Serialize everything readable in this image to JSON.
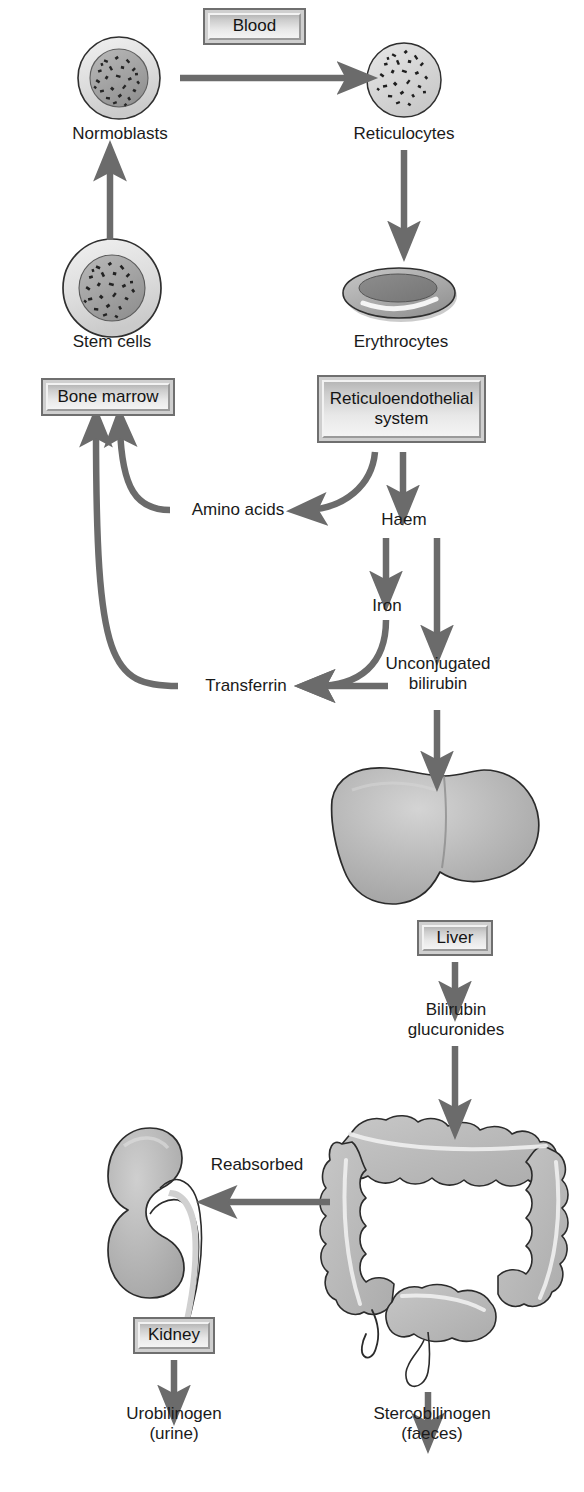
{
  "diagram": {
    "palette": {
      "arrow": "#6b6b6b",
      "outline": "#2a2a2a",
      "organ_fill": "#b4b4b4",
      "organ_light": "#d2d2d2",
      "organ_dark": "#9a9a9a",
      "box_border": "#6f6f6f",
      "box_fill": "#e3e3e3",
      "text": "#141414",
      "background": "#ffffff"
    },
    "boxes": [
      {
        "id": "blood",
        "label": "Blood",
        "x": 203,
        "y": 8,
        "w": 103,
        "h": 37
      },
      {
        "id": "bone-marrow",
        "label": "Bone marrow",
        "x": 41,
        "y": 378,
        "w": 134,
        "h": 38
      },
      {
        "id": "reticuloendothelial-system",
        "label": "Reticuloendothelial\nsystem",
        "x": 317,
        "y": 375,
        "w": 169,
        "h": 68
      },
      {
        "id": "liver",
        "label": "Liver",
        "x": 417,
        "y": 920,
        "w": 76,
        "h": 36
      },
      {
        "id": "kidney",
        "label": "Kidney",
        "x": 133,
        "y": 1317,
        "w": 82,
        "h": 37
      }
    ],
    "cell_labels": [
      {
        "id": "normoblasts",
        "label": "Normoblasts",
        "x": 60,
        "y": 124
      },
      {
        "id": "reticulocytes",
        "label": "Reticulocytes",
        "x": 338,
        "y": 124
      },
      {
        "id": "stem-cells",
        "label": "Stem cells",
        "x": 58,
        "y": 332
      },
      {
        "id": "erythrocytes",
        "label": "Erythrocytes",
        "x": 340,
        "y": 332
      }
    ],
    "node_labels": [
      {
        "id": "amino-acids",
        "label": "Amino acids",
        "x": 186,
        "y": 510
      },
      {
        "id": "haem",
        "label": "Haem",
        "x": 389,
        "y": 520
      },
      {
        "id": "iron",
        "label": "Iron",
        "x": 364,
        "y": 605
      },
      {
        "id": "transferrin",
        "label": "Transferrin",
        "x": 193,
        "y": 686
      },
      {
        "id": "unconjugated-bilirubin",
        "label": "Unconjugated\nbilirubin",
        "x": 396,
        "y": 659
      },
      {
        "id": "bilirubin-glucuronides",
        "label": "Bilirubin\nglucuronides",
        "x": 391,
        "y": 1004
      },
      {
        "id": "reabsorbed",
        "label": "Reabsorbed",
        "x": 209,
        "y": 1157
      },
      {
        "id": "urobilinogen",
        "label": "Urobilinogen\n(urine)",
        "x": 110,
        "y": 1400
      },
      {
        "id": "stercobilinogen",
        "label": "Stercobilinogen\n(faeces)",
        "x": 391,
        "y": 1400
      }
    ],
    "organs": [
      {
        "id": "normoblast-cell",
        "kind": "cell-nucleated",
        "cx": 119,
        "cy": 78,
        "r": 40
      },
      {
        "id": "reticulocyte-cell",
        "kind": "cell-speckled",
        "cx": 404,
        "cy": 80,
        "r": 36
      },
      {
        "id": "stem-cell",
        "kind": "cell-nucleated",
        "cx": 112,
        "cy": 288,
        "r": 48
      },
      {
        "id": "erythrocyte-cell",
        "kind": "biconcave-disc",
        "cx": 400,
        "cy": 294
      },
      {
        "id": "liver-organ",
        "kind": "liver",
        "cx": 420,
        "cy": 845
      },
      {
        "id": "colon-organ",
        "kind": "colon",
        "cx": 430,
        "cy": 1215
      },
      {
        "id": "kidney-organ",
        "kind": "kidney",
        "cx": 170,
        "cy": 1215
      }
    ],
    "flow_edges": [
      {
        "id": "stem-to-normoblast",
        "from": "stem-cells",
        "to": "normoblasts",
        "style": "straight-up"
      },
      {
        "id": "normoblast-to-reticulocyte",
        "from": "normoblasts",
        "to": "reticulocytes",
        "style": "straight-right",
        "via": "blood"
      },
      {
        "id": "reticulocyte-to-erythrocyte",
        "from": "reticulocytes",
        "to": "erythrocytes",
        "style": "straight-down"
      },
      {
        "id": "res-to-amino-acids",
        "from": "reticuloendothelial-system",
        "to": "amino-acids",
        "style": "curve-left"
      },
      {
        "id": "res-to-haem",
        "from": "reticuloendothelial-system",
        "to": "haem",
        "style": "straight-down"
      },
      {
        "id": "amino-acids-to-bone-marrow",
        "from": "amino-acids",
        "to": "bone-marrow",
        "style": "curve-up"
      },
      {
        "id": "haem-to-iron",
        "from": "haem",
        "to": "iron",
        "style": "straight-down"
      },
      {
        "id": "haem-to-unconjugated-bilirubin",
        "from": "haem",
        "to": "unconjugated-bilirubin",
        "style": "straight-down"
      },
      {
        "id": "iron-to-transferrin",
        "from": "iron",
        "to": "transferrin",
        "style": "curve-left-down"
      },
      {
        "id": "unconjugated-bilirubin-to-transferrin",
        "from": "unconjugated-bilirubin",
        "to": "transferrin",
        "style": "straight-left"
      },
      {
        "id": "transferrin-to-bone-marrow",
        "from": "transferrin",
        "to": "bone-marrow",
        "style": "curve-up-long"
      },
      {
        "id": "unconjugated-bilirubin-to-liver",
        "from": "unconjugated-bilirubin",
        "to": "liver-organ",
        "style": "straight-down"
      },
      {
        "id": "liver-to-bilirubin-glucuronides",
        "from": "liver",
        "to": "bilirubin-glucuronides",
        "style": "straight-down"
      },
      {
        "id": "bilirubin-glucuronides-to-colon",
        "from": "bilirubin-glucuronides",
        "to": "colon-organ",
        "style": "straight-down"
      },
      {
        "id": "colon-to-kidney",
        "from": "colon-organ",
        "to": "kidney-organ",
        "style": "straight-left",
        "via": "reabsorbed"
      },
      {
        "id": "kidney-to-urobilinogen",
        "from": "kidney",
        "to": "urobilinogen",
        "style": "straight-down"
      },
      {
        "id": "colon-to-stercobilinogen",
        "from": "colon-organ",
        "to": "stercobilinogen",
        "style": "straight-down"
      }
    ]
  }
}
